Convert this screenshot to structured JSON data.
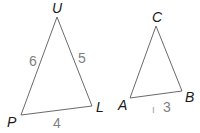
{
  "diagram": {
    "triangles": [
      {
        "name": "UPL",
        "vertices": {
          "U": {
            "label": "U",
            "x": 57,
            "y": 17,
            "lx": 52,
            "ly": 13
          },
          "P": {
            "label": "P",
            "x": 21,
            "y": 115,
            "lx": 7,
            "ly": 127
          },
          "L": {
            "label": "L",
            "x": 92,
            "y": 106,
            "lx": 96,
            "ly": 112
          }
        },
        "sides": [
          {
            "label": "6",
            "between": "UP",
            "x": 29,
            "y": 66
          },
          {
            "label": "5",
            "between": "UL",
            "x": 78,
            "y": 63
          },
          {
            "label": "4",
            "between": "PL",
            "x": 53,
            "y": 128
          }
        ]
      },
      {
        "name": "ACB",
        "vertices": {
          "C": {
            "label": "C",
            "x": 156,
            "y": 26,
            "lx": 152,
            "ly": 22
          },
          "A": {
            "label": "A",
            "x": 130,
            "y": 98,
            "lx": 118,
            "ly": 110
          },
          "B": {
            "label": "B",
            "x": 182,
            "y": 91,
            "lx": 185,
            "ly": 102
          }
        },
        "sides": [
          {
            "label": "3",
            "between": "AB",
            "x": 163,
            "y": 112
          }
        ],
        "marks": [
          {
            "label": "ı",
            "x": 152,
            "y": 113
          }
        ]
      }
    ]
  }
}
